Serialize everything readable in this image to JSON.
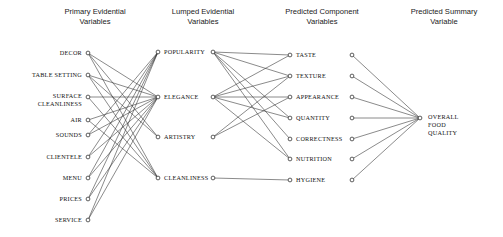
{
  "figure": {
    "title": "",
    "background": "#ffffff",
    "edge_color": "#2b2b2b",
    "node_color": "#1a1a1a",
    "width": 503,
    "height": 237
  },
  "columns": [
    {
      "id": "primary",
      "title_line1": "Primary Evidential",
      "title_line2": "Variables",
      "title_x": 95,
      "title_y_1": 14,
      "title_y_2": 24,
      "node_x": 88,
      "label_anchor": "right",
      "label_dx": -6,
      "nodes": [
        {
          "id": "decor",
          "label": "DECOR",
          "y": 53
        },
        {
          "id": "table_setting",
          "label": "TABLE SETTING",
          "y": 75
        },
        {
          "id": "surface_cleanliness",
          "label": "SURFACE",
          "label2": "CLEANLINESS",
          "y": 97
        },
        {
          "id": "air",
          "label": "AIR",
          "y": 120
        },
        {
          "id": "sounds",
          "label": "SOUNDS",
          "y": 135
        },
        {
          "id": "clientele",
          "label": "CLIENTELE",
          "y": 157
        },
        {
          "id": "menu",
          "label": "MENU",
          "y": 178
        },
        {
          "id": "prices",
          "label": "PRICES",
          "y": 199
        },
        {
          "id": "service",
          "label": "SERVICE",
          "y": 220
        }
      ]
    },
    {
      "id": "lumped",
      "title_line1": "Lumped Evidential",
      "title_line2": "Variables",
      "title_x": 203,
      "title_y_1": 14,
      "title_y_2": 24,
      "node_x": 158,
      "out_node_x": 213,
      "label_anchor": "left",
      "label_dx": 6,
      "nodes": [
        {
          "id": "popularity",
          "label": "POPULARITY",
          "y": 52
        },
        {
          "id": "elegance",
          "label": "ELEGANCE",
          "y": 97
        },
        {
          "id": "artistry",
          "label": "ARTISTRY",
          "y": 137
        },
        {
          "id": "cleanliness",
          "label": "CLEANLINESS",
          "y": 178
        }
      ]
    },
    {
      "id": "component",
      "title_line1": "Predicted Component",
      "title_line2": "Variables",
      "title_x": 322,
      "title_y_1": 14,
      "title_y_2": 24,
      "node_x": 290,
      "out_node_x": 352,
      "label_anchor": "left",
      "label_dx": 6,
      "nodes": [
        {
          "id": "taste",
          "label": "TASTE",
          "y": 55
        },
        {
          "id": "texture",
          "label": "TEXTURE",
          "y": 76
        },
        {
          "id": "appearance",
          "label": "APPEARANCE",
          "y": 97
        },
        {
          "id": "quantity",
          "label": "QUANTITY",
          "y": 118
        },
        {
          "id": "correctness",
          "label": "CORRECTNESS",
          "y": 139
        },
        {
          "id": "nutrition",
          "label": "NUTRITION",
          "y": 159
        },
        {
          "id": "hygiene",
          "label": "HYGIENE",
          "y": 180
        }
      ]
    },
    {
      "id": "summary",
      "title_line1": "Predicted Summary",
      "title_line2": "Variable",
      "title_x": 444,
      "title_y_1": 14,
      "title_y_2": 24,
      "node_x": 420,
      "label_anchor": "left",
      "label_dx": 8,
      "nodes": [
        {
          "id": "overall_food_quality",
          "label": "OVERALL",
          "label2": "FOOD",
          "label3": "QUALITY",
          "y": 118
        }
      ]
    }
  ],
  "edges": {
    "primary_to_lumped": [
      {
        "from": "decor",
        "to": "elegance"
      },
      {
        "from": "decor",
        "to": "artistry"
      },
      {
        "from": "decor",
        "to": "cleanliness"
      },
      {
        "from": "table_setting",
        "to": "elegance"
      },
      {
        "from": "table_setting",
        "to": "artistry"
      },
      {
        "from": "table_setting",
        "to": "cleanliness"
      },
      {
        "from": "surface_cleanliness",
        "to": "elegance"
      },
      {
        "from": "surface_cleanliness",
        "to": "cleanliness"
      },
      {
        "from": "air",
        "to": "elegance"
      },
      {
        "from": "air",
        "to": "cleanliness"
      },
      {
        "from": "sounds",
        "to": "popularity"
      },
      {
        "from": "sounds",
        "to": "elegance"
      },
      {
        "from": "clientele",
        "to": "popularity"
      },
      {
        "from": "clientele",
        "to": "elegance"
      },
      {
        "from": "menu",
        "to": "popularity"
      },
      {
        "from": "menu",
        "to": "elegance"
      },
      {
        "from": "prices",
        "to": "popularity"
      },
      {
        "from": "prices",
        "to": "elegance"
      },
      {
        "from": "service",
        "to": "popularity"
      },
      {
        "from": "service",
        "to": "elegance"
      }
    ],
    "lumped_to_component": [
      {
        "from": "popularity",
        "to": "taste"
      },
      {
        "from": "popularity",
        "to": "texture"
      },
      {
        "from": "popularity",
        "to": "quantity"
      },
      {
        "from": "popularity",
        "to": "correctness"
      },
      {
        "from": "popularity",
        "to": "nutrition"
      },
      {
        "from": "elegance",
        "to": "taste"
      },
      {
        "from": "elegance",
        "to": "texture"
      },
      {
        "from": "elegance",
        "to": "appearance"
      },
      {
        "from": "elegance",
        "to": "quantity"
      },
      {
        "from": "elegance",
        "to": "nutrition"
      },
      {
        "from": "artistry",
        "to": "texture"
      },
      {
        "from": "artistry",
        "to": "appearance"
      },
      {
        "from": "cleanliness",
        "to": "hygiene"
      }
    ],
    "component_to_summary": [
      {
        "from": "taste",
        "to": "overall_food_quality"
      },
      {
        "from": "texture",
        "to": "overall_food_quality"
      },
      {
        "from": "appearance",
        "to": "overall_food_quality"
      },
      {
        "from": "quantity",
        "to": "overall_food_quality"
      },
      {
        "from": "correctness",
        "to": "overall_food_quality"
      },
      {
        "from": "nutrition",
        "to": "overall_food_quality"
      },
      {
        "from": "hygiene",
        "to": "overall_food_quality"
      }
    ]
  }
}
